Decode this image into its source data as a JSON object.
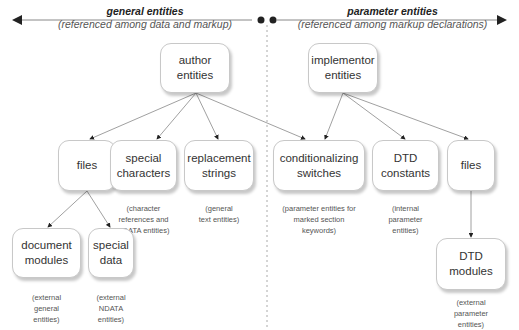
{
  "header": {
    "left": {
      "title": "general entities",
      "subtitle": "(referenced among data and markup)"
    },
    "right": {
      "title": "parameter entities",
      "subtitle": "(referenced among markup declarations)"
    }
  },
  "boxes": {
    "author": "author\nentities",
    "implementor": "implementor\nentities",
    "files_left": "files",
    "special_characters": "special\ncharacters",
    "replacement_strings": "replacement\nstrings",
    "conditionalizing_switches": "conditionalizing\nswitches",
    "dtd_constants": "DTD\nconstants",
    "files_right": "files",
    "document_modules": "document\nmodules",
    "special_data": "special\ndata",
    "dtd_modules": "DTD\nmodules"
  },
  "notes": {
    "special_characters": "(character\nreferences and\nSDATA entities)",
    "replacement_strings": "(general\ntext entities)",
    "conditionalizing_switches": "(parameter entities for\nmarked section\nkeywords)",
    "dtd_constants": "(internal\nparameter\nentities)",
    "document_modules": "(external\ngeneral\nentities)",
    "special_data": "(external\nNDATA\nentities)",
    "dtd_modules": "(external\nparameter\nentities)"
  },
  "colors": {
    "line": "#888888",
    "arrow": "#222222",
    "divider": "#aaaaaa"
  }
}
